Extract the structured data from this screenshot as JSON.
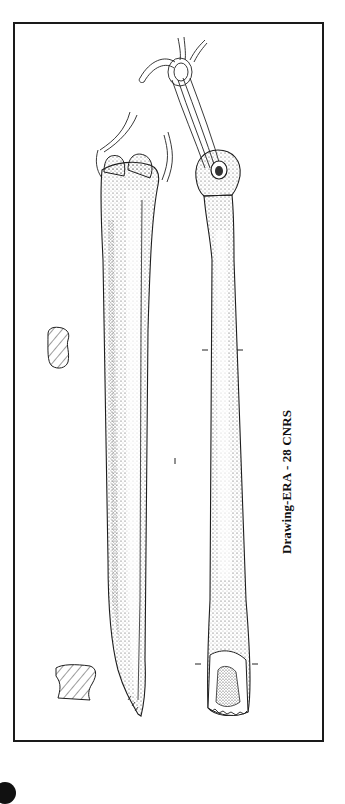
{
  "figure": {
    "caption": "Drawing-ERA - 28 CNRS",
    "objects": [
      {
        "name": "left-bone-tool",
        "view": "side profile",
        "ends": [
          "articular end with cord (top)",
          "pointed tip (bottom)"
        ]
      },
      {
        "name": "right-bone-tool",
        "view": "face",
        "ends": [
          "perforated head with looped cord (top)",
          "worked distal end (bottom)"
        ]
      }
    ],
    "cross_sections": [
      {
        "name": "upper-cross-section",
        "shape": "rounded rectangle",
        "hatching": "diagonal"
      },
      {
        "name": "lower-cross-section",
        "shape": "irregular trapezoid",
        "hatching": "diagonal"
      }
    ],
    "colors": {
      "ink": "#1a1a1a",
      "paper": "#ffffff",
      "stipple": "#555555"
    }
  }
}
